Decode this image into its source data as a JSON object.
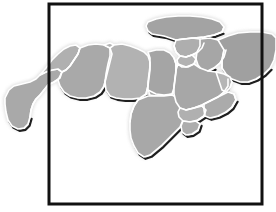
{
  "figure": {
    "kind": "map-figure",
    "background_color": "#ffffff"
  },
  "frame": {
    "name": "map-border-frame",
    "color": "#111111",
    "stroke_width": 3,
    "x": 49,
    "y": 4,
    "width": 213,
    "height": 200
  },
  "style": {
    "land_fill": "#a9a9a9",
    "land_fill_light": "#bdbdbd",
    "land_fill_dark": "#9a9a9a",
    "country_border_color": "#ffffff",
    "country_border_width": 1.6,
    "coast_shadow_color": "#1f1f1f",
    "coast_shadow_width": 2.2,
    "soft_edge_color": "#cfcfcf",
    "water_color": "#ffffff"
  },
  "regions": [
    {
      "name": "mauritania",
      "label": "Mauritania",
      "fill": "#a9a9a9",
      "path": "M 5 98 L 9 90 L 14 86 L 22 84 L 30 82 L 36 79 L 40 75 L 46 72 L 52 70 L 58 69 L 62 72 L 60 78 L 54 82 L 48 85 L 44 90 L 40 95 L 36 99 L 33 104 L 31 110 L 30 117 L 28 124 L 24 128 L 18 129 L 12 126 L 8 120 L 6 112 L 5 104 Z",
      "shadow": "M 5 104 L 6 112 L 8 120 L 12 126 L 18 129 L 24 128 L 28 124 L 30 117",
      "borders": [
        "M 62 72 L 60 78 L 54 82 L 48 85 L 44 90 L 40 95 L 36 99 L 33 104 L 31 110 L 30 117"
      ]
    },
    {
      "name": "morocco",
      "label": "Morocco",
      "fill": "#b0b0b0",
      "path": "M 40 75 L 46 68 L 52 60 L 58 54 L 64 49 L 70 46 L 76 45 L 80 48 L 78 54 L 74 60 L 70 66 L 66 70 L 62 72 L 58 69 L 52 70 L 46 72 Z",
      "shadow": "",
      "borders": [
        "M 80 48 L 78 54 L 74 60 L 70 66 L 66 70 L 62 72"
      ]
    },
    {
      "name": "algeria",
      "label": "Algeria",
      "fill": "#a9a9a9",
      "path": "M 62 72 L 66 70 L 70 66 L 74 60 L 78 54 L 80 48 L 88 45 L 96 44 L 104 45 L 110 48 L 112 54 L 110 62 L 108 70 L 106 78 L 104 86 L 100 92 L 94 96 L 86 98 L 78 98 L 70 96 L 64 92 L 60 86 L 58 80 Z",
      "shadow": "M 58 80 L 60 86 L 64 92 L 70 96 L 78 98 L 86 98 L 94 96 L 100 92 L 104 86",
      "borders": [
        "M 110 48 L 112 54 L 110 62 L 108 70 L 106 78 L 104 86"
      ]
    },
    {
      "name": "tunisia",
      "label": "Tunisia",
      "fill": "#b4b4b4",
      "path": "M 104 45 L 110 43 L 114 45 L 113 52 L 111 58 L 110 62 L 112 54 L 110 48 Z",
      "shadow": "",
      "borders": []
    },
    {
      "name": "libya",
      "label": "Libya",
      "fill": "#b2b2b2",
      "path": "M 110 48 L 114 45 L 122 44 L 130 46 L 138 49 L 144 52 L 148 56 L 150 62 L 150 70 L 149 78 L 148 86 L 146 94 L 140 98 L 132 99 L 124 99 L 116 98 L 110 96 L 106 90 L 105 82 L 106 74 L 108 64 L 110 56 Z",
      "shadow": "M 106 90 L 110 96 L 116 98 L 124 99 L 132 99 L 140 98 L 146 94",
      "borders": [
        "M 150 62 L 150 70 L 149 78 L 148 86 L 146 94"
      ]
    },
    {
      "name": "egypt",
      "label": "Egypt",
      "fill": "#a5a5a5",
      "path": "M 148 52 L 156 50 L 164 50 L 170 53 L 174 58 L 176 64 L 176 72 L 175 80 L 174 88 L 172 94 L 164 96 L 156 96 L 150 95 L 148 90 L 148 82 L 149 74 L 150 66 L 150 58 Z",
      "shadow": "M 148 90 L 150 95 L 156 96 L 164 96 L 172 94",
      "borders": [
        "M 148 90 L 156 94 L 164 95 L 172 94",
        "M 174 58 L 176 64 L 176 72 L 175 80 L 174 88"
      ]
    },
    {
      "name": "sudan",
      "label": "Sudan",
      "fill": "#a8a8a8",
      "path": "M 148 96 L 156 96 L 164 96 L 172 95 L 178 98 L 182 104 L 184 112 L 183 120 L 180 127 L 174 133 L 168 139 L 162 145 L 156 150 L 150 155 L 144 157 L 138 153 L 134 146 L 131 138 L 130 130 L 130 122 L 131 114 L 134 106 L 138 100 Z",
      "shadow": "M 130 122 L 131 138 L 134 146 L 138 153 L 144 157 L 150 155 L 156 150 L 162 145 L 168 139 L 174 133 L 180 127 L 183 120",
      "borders": [
        "M 138 100 L 134 106 L 131 114 L 130 122"
      ]
    },
    {
      "name": "turkey",
      "label": "Turkey",
      "fill": "#a3a3a3",
      "path": "M 148 22 L 156 19 L 166 17 L 178 16 L 190 16 L 202 17 L 212 19 L 220 22 L 224 27 L 222 32 L 214 35 L 204 37 L 194 38 L 184 39 L 176 40 L 170 38 L 164 36 L 158 35 L 152 34 L 148 31 L 146 26 Z",
      "shadow": "M 146 26 L 148 31 L 152 34 L 158 35 L 164 36 L 170 38 L 176 40 L 184 39 L 194 38 L 204 37 L 214 35 L 222 32",
      "borders": [
        "M 176 40 L 184 39 L 194 38 L 204 37 L 214 35 L 222 32 L 224 27"
      ]
    },
    {
      "name": "syria",
      "label": "Syria",
      "fill": "#aeaeae",
      "path": "M 176 40 L 184 39 L 192 38 L 200 39 L 204 43 L 202 48 L 198 52 L 192 55 L 186 57 L 180 56 L 176 52 L 174 46 Z",
      "shadow": "",
      "borders": [
        "M 204 43 L 202 48 L 198 52 L 192 55 L 186 57",
        "M 174 46 L 176 52 L 180 56 L 186 57"
      ]
    },
    {
      "name": "iraq",
      "label": "Iraq",
      "fill": "#a6a6a6",
      "path": "M 200 39 L 210 38 L 218 40 L 224 44 L 226 50 L 224 57 L 220 63 L 214 68 L 208 71 L 202 70 L 198 65 L 196 59 L 197 52 L 200 46 Z",
      "shadow": "M 196 59 L 198 65 L 202 70 L 208 71 L 214 68",
      "borders": [
        "M 226 50 L 224 57 L 220 63 L 214 68 L 208 71"
      ]
    },
    {
      "name": "iran",
      "label": "Iran",
      "fill": "#a0a0a0",
      "path": "M 218 40 L 228 36 L 238 33 L 250 32 L 262 32 L 272 34 L 276 38 L 276 50 L 274 60 L 270 68 L 264 74 L 256 79 L 248 82 L 240 82 L 232 79 L 226 74 L 222 68 L 222 60 L 224 50 Z",
      "shadow": "M 222 68 L 226 74 L 232 79 L 240 82 L 248 82 L 256 79 L 264 74 L 270 68",
      "borders": [
        "M 224 50 L 222 60 L 222 68"
      ]
    },
    {
      "name": "jordan",
      "label": "Jordan",
      "fill": "#b2b2b2",
      "path": "M 180 56 L 186 57 L 192 55 L 196 59 L 194 64 L 188 67 L 182 67 L 178 64 L 177 60 Z",
      "shadow": "",
      "borders": [
        "M 196 59 L 194 64 L 188 67 L 182 67 L 178 64"
      ]
    },
    {
      "name": "saudi-arabia",
      "label": "Saudi Arabia",
      "fill": "#a7a7a7",
      "path": "M 178 64 L 186 67 L 194 64 L 200 68 L 208 71 L 216 72 L 224 74 L 228 79 L 228 86 L 224 92 L 218 97 L 210 101 L 202 105 L 194 108 L 186 110 L 180 108 L 176 102 L 174 94 L 174 86 L 175 78 L 176 70 Z",
      "shadow": "M 174 94 L 176 102 L 180 108 L 186 110 L 194 108 L 202 105 L 210 101 L 218 97 L 224 92 L 228 86",
      "borders": [
        "M 228 79 L 228 86 L 224 92 L 218 97 L 210 101",
        "M 186 110 L 194 108 L 202 105 L 210 101"
      ]
    },
    {
      "name": "yemen",
      "label": "Yemen",
      "fill": "#b0b0b0",
      "path": "M 180 108 L 186 110 L 194 108 L 202 106 L 206 110 L 204 116 L 198 120 L 190 122 L 183 121 L 179 117 L 178 112 Z",
      "shadow": "M 178 112 L 179 117 L 183 121 L 190 122 L 198 120 L 204 116 L 206 110",
      "borders": [
        "M 202 106 L 206 110 L 204 116 L 198 120"
      ]
    },
    {
      "name": "oman",
      "label": "Oman",
      "fill": "#ababab",
      "path": "M 204 104 L 212 100 L 220 96 L 228 92 L 234 94 L 236 100 L 232 107 L 226 112 L 218 116 L 210 118 L 205 116 L 204 110 Z",
      "shadow": "M 204 110 L 205 116 L 210 118 L 218 116 L 226 112 L 232 107 L 236 100",
      "borders": [
        "M 234 94 L 236 100 L 232 107 L 226 112"
      ]
    },
    {
      "name": "gulf-states",
      "label": "Gulf States",
      "fill": "#b6b6b6",
      "path": "M 216 72 L 224 74 L 230 77 L 232 82 L 230 88 L 226 92 L 222 90 L 220 84 L 218 78 Z",
      "shadow": "",
      "borders": [
        "M 232 82 L 230 88 L 226 92"
      ]
    },
    {
      "name": "somalia-horn",
      "label": "Horn of Africa",
      "fill": "#adadad",
      "path": "M 183 121 L 190 122 L 196 121 L 200 124 L 198 130 L 192 134 L 186 135 L 182 132 L 181 126 Z",
      "shadow": "M 181 126 L 182 132 L 186 135 L 192 134 L 198 130 L 200 124",
      "borders": []
    }
  ]
}
